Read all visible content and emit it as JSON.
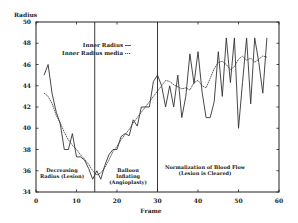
{
  "chart_data": {
    "type": "line",
    "title": "",
    "xlabel": "Frame",
    "ylabel": "Radius",
    "xlim": [
      0,
      60
    ],
    "ylim": [
      34,
      50
    ],
    "x_ticks": [
      0,
      10,
      20,
      30,
      40,
      50,
      60
    ],
    "y_ticks": [
      34,
      36,
      38,
      40,
      42,
      44,
      46,
      48,
      50
    ],
    "grid": false,
    "legend_position": "upper-left-inside",
    "series": [
      {
        "name": "Inner Radius",
        "x": [
          2,
          3,
          4,
          5,
          6,
          7,
          8,
          9,
          10,
          11,
          12,
          13,
          14,
          15,
          16,
          17,
          18,
          19,
          20,
          21,
          22,
          23,
          24,
          25,
          26,
          27,
          28,
          29,
          30,
          31,
          32,
          33,
          34,
          35,
          36,
          37,
          38,
          39,
          40,
          41,
          42,
          43,
          44,
          45,
          46,
          47,
          48,
          49,
          50,
          51,
          52,
          53,
          54,
          55,
          56,
          57
        ],
        "values": [
          45.0,
          46.0,
          43.2,
          41.5,
          40.4,
          38.0,
          38.0,
          39.5,
          37.3,
          37.3,
          37.0,
          36.2,
          35.2,
          36.0,
          35.2,
          36.5,
          37.5,
          38.0,
          38.0,
          39.2,
          39.5,
          39.3,
          40.8,
          40.2,
          42.0,
          42.0,
          42.0,
          44.4,
          45.0,
          44.0,
          42.0,
          44.0,
          42.0,
          45.0,
          41.0,
          43.0,
          47.0,
          44.2,
          47.2,
          43.4,
          41.0,
          41.0,
          42.5,
          47.2,
          43.0,
          48.5,
          44.3,
          48.5,
          40.0,
          44.3,
          48.5,
          42.3,
          48.5,
          46.2,
          43.3,
          48.5
        ],
        "color": "#333333"
      },
      {
        "name": "Inner Radius media",
        "x": [
          2,
          3,
          4,
          5,
          6,
          7,
          8,
          9,
          10,
          11,
          12,
          13,
          14,
          15,
          16,
          17,
          18,
          19,
          20,
          21,
          22,
          23,
          24,
          25,
          26,
          27,
          28,
          29,
          30,
          31,
          32,
          33,
          34,
          35,
          36,
          37,
          38,
          39,
          40,
          41,
          42,
          43,
          44,
          45,
          46,
          47,
          48,
          49,
          50,
          51,
          52,
          53,
          54,
          55,
          56,
          57
        ],
        "values": [
          43.3,
          43.0,
          42.3,
          41.2,
          40.5,
          39.6,
          38.9,
          38.4,
          38.0,
          37.5,
          37.1,
          36.6,
          36.0,
          35.6,
          35.8,
          36.3,
          37.0,
          37.8,
          38.3,
          38.9,
          39.4,
          39.9,
          40.5,
          41.0,
          41.5,
          42.0,
          42.5,
          43.0,
          43.5,
          44.0,
          44.5,
          44.4,
          44.1,
          43.9,
          43.7,
          43.8,
          43.6,
          44.3,
          44.5,
          44.0,
          43.8,
          44.7,
          45.6,
          46.2,
          46.3,
          46.0,
          45.5,
          45.8,
          46.5,
          46.8,
          46.4,
          46.6,
          46.2,
          46.5,
          46.8,
          46.7
        ],
        "color": "#333333",
        "style": "dotted"
      }
    ],
    "vertical_markers": [
      {
        "x": 14.5,
        "label": ""
      },
      {
        "x": 30,
        "label": ""
      }
    ],
    "annotations": [
      {
        "text": [
          "Decreasing",
          "Radius (Lesion)"
        ],
        "x": 6,
        "y": 35.7
      },
      {
        "text": [
          "Balloon",
          "Inflating",
          "(Angioplasty)"
        ],
        "x": 22.5,
        "y": 35.7
      },
      {
        "text": [
          "Normalization of Blood Flow",
          "(Lesion is Cleared)"
        ],
        "x": 44.5,
        "y": 36.2
      }
    ]
  },
  "labels": {
    "ylabel": "Radius",
    "xlabel": "Frame",
    "legend_1": "Inner Radius",
    "legend_2": "Inner Radius media",
    "annot_1_a": "Decreasing",
    "annot_1_b": "Radius (Lesion)",
    "annot_2_a": "Balloon",
    "annot_2_b": "Inflating",
    "annot_2_c": "(Angioplasty)",
    "annot_3_a": "Normalization of Blood Flow",
    "annot_3_b": "(Lesion is Cleared)"
  }
}
